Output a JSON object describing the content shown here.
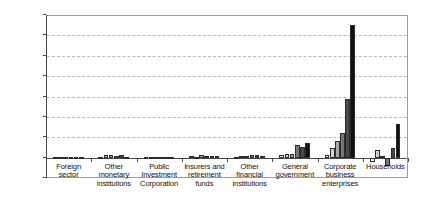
{
  "chart_data": {
    "type": "bar",
    "title": "",
    "subtitle": "",
    "xlabel": "",
    "ylabel": "",
    "ylim": [
      -20000,
      140000
    ],
    "ytick_step": 20000,
    "yticks": [
      140000,
      120000,
      100000,
      80000,
      60000,
      40000,
      20000,
      0,
      -20000
    ],
    "ytick_labels": [
      "140000",
      "120000",
      "100000",
      "80000",
      "60000",
      "40000",
      "20000",
      "0",
      "-20000"
    ],
    "grid": true,
    "grid_axis": "y",
    "legend": false,
    "legend_position": "none",
    "categories": [
      "Foreign sector",
      "Other monetary institutions",
      "Public Investment Corporation",
      "Insurers and retirement funds",
      "Other financial institutions",
      "General government",
      "Corporate business enterprises",
      "Households"
    ],
    "category_lines": [
      [
        "Foreign",
        "sector"
      ],
      [
        "Other",
        "monetary",
        "institutions"
      ],
      [
        "Public",
        "Investment",
        "Corporation"
      ],
      [
        "Insurers and",
        "retirement",
        "funds"
      ],
      [
        "Other",
        "financial",
        "institutions"
      ],
      [
        "General",
        "government"
      ],
      [
        "Corporate",
        "business",
        "enterprises"
      ],
      [
        "Households"
      ]
    ],
    "series": [
      {
        "name": "Series 1",
        "color": "#ffffff",
        "values": [
          300,
          900,
          400,
          1400,
          700,
          2500,
          3000,
          -4200
        ]
      },
      {
        "name": "Series 2",
        "color": "#d0d0d0",
        "values": [
          400,
          2100,
          700,
          900,
          1600,
          3200,
          9500,
          7800
        ]
      },
      {
        "name": "Series 3",
        "color": "#a8a8a8",
        "values": [
          600,
          2600,
          900,
          2900,
          1200,
          4000,
          16000,
          1200
        ]
      },
      {
        "name": "Series 4",
        "color": "#777777",
        "values": [
          500,
          1500,
          600,
          1200,
          2200,
          12500,
          24000,
          -8500
        ]
      },
      {
        "name": "Series 5",
        "color": "#4a4a4a",
        "values": [
          700,
          2400,
          800,
          1600,
          2600,
          10000,
          58000,
          9500
        ]
      },
      {
        "name": "Series 6",
        "color": "#111111",
        "values": [
          900,
          1100,
          500,
          2000,
          1800,
          14000,
          130000,
          33000
        ]
      }
    ]
  }
}
